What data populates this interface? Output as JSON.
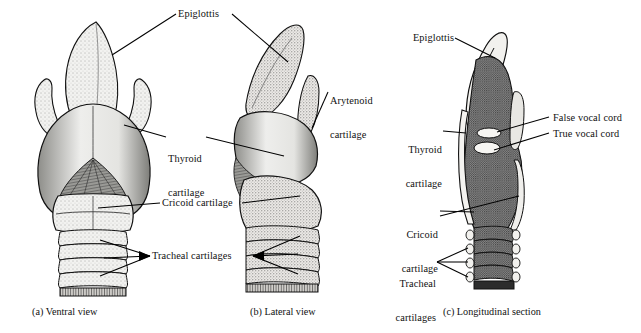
{
  "figure": {
    "background": "#ffffff",
    "ink": "#000000",
    "stipple_light": "#d9d9d9",
    "stipple_mid": "#9a9a9a",
    "stipple_dark": "#6b6b6b",
    "section_fill": "#8a8a8a"
  },
  "panels": [
    {
      "id": "a",
      "caption": "(a) Ventral view"
    },
    {
      "id": "b",
      "caption": "(b) Lateral view"
    },
    {
      "id": "c",
      "caption": "(c) Longitudinal section"
    }
  ],
  "labels": {
    "shared": [
      {
        "name": "epiglottis",
        "text": "Epiglottis",
        "lines": [
          "Epiglottis"
        ]
      },
      {
        "name": "thyroid-cartilage",
        "text": "Thyroid cartilage",
        "lines": [
          "Thyroid",
          "cartilage"
        ]
      },
      {
        "name": "arytenoid-cartilage",
        "text": "Arytenoid cartilage",
        "lines": [
          "Arytenoid",
          "cartilage"
        ]
      },
      {
        "name": "cricoid-cartilage",
        "text": "Cricoid cartilage",
        "lines": [
          "Cricoid cartilage"
        ]
      },
      {
        "name": "tracheal-cartilages",
        "text": "Tracheal cartilages",
        "lines": [
          "Tracheal cartilages"
        ]
      }
    ],
    "panel_c": [
      {
        "name": "epiglottis-c",
        "text": "Epiglottis",
        "lines": [
          "Epiglottis"
        ]
      },
      {
        "name": "thyroid-cartilage-c",
        "text": "Thyroid cartilage",
        "lines": [
          "Thyroid",
          "cartilage"
        ]
      },
      {
        "name": "false-vocal-cord",
        "text": "False vocal cord",
        "lines": [
          "False vocal cord"
        ]
      },
      {
        "name": "true-vocal-cord",
        "text": "True vocal cord",
        "lines": [
          "True vocal cord"
        ]
      },
      {
        "name": "cricoid-cartilage-c",
        "text": "Cricoid cartilage",
        "lines": [
          "Cricoid",
          "cartilage"
        ]
      },
      {
        "name": "tracheal-cartilages-c",
        "text": "Tracheal cartilages",
        "lines": [
          "Tracheal",
          "cartilages"
        ]
      }
    ]
  },
  "text": {
    "epiglottis": "Epiglottis",
    "thyroid_1": "Thyroid",
    "thyroid_2": "cartilage",
    "arytenoid_1": "Arytenoid",
    "arytenoid_2": "cartilage",
    "cricoid": "Cricoid cartilage",
    "tracheal": "Tracheal cartilages",
    "epiglottis_c": "Epiglottis",
    "thyroid_c_1": "Thyroid",
    "thyroid_c_2": "cartilage",
    "false_cord": "False vocal cord",
    "true_cord": "True vocal cord",
    "cricoid_c_1": "Cricoid",
    "cricoid_c_2": "cartilage",
    "tracheal_c_1": "Tracheal",
    "tracheal_c_2": "cartilages",
    "cap_a": "(a) Ventral view",
    "cap_b": "(b) Lateral view",
    "cap_c": "(c) Longitudinal section"
  }
}
